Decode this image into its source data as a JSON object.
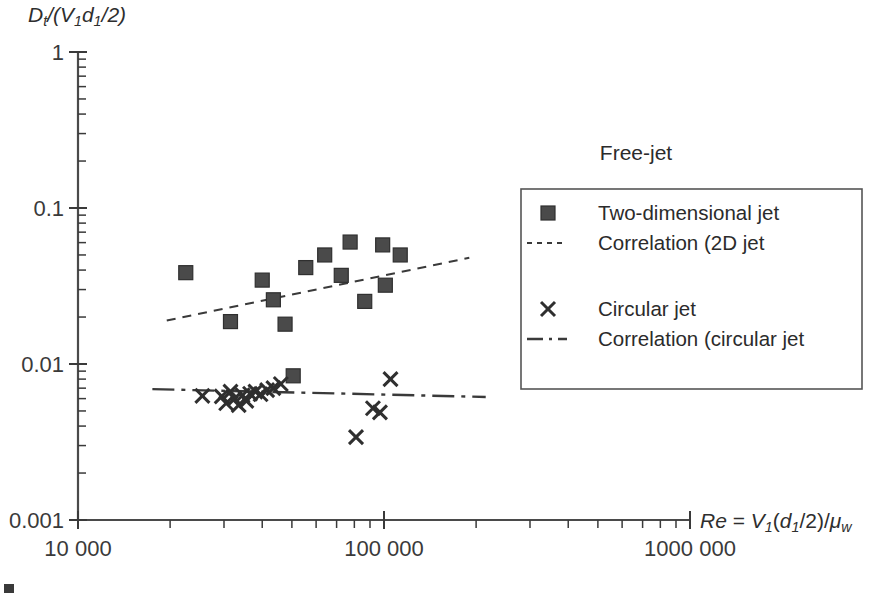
{
  "figure": {
    "background_color": "#ffffff",
    "ink_color": "#3a3a3a",
    "marker_color": "#4a4a4a",
    "note": "Free-jet",
    "caption_fragment": ""
  },
  "chart_data": {
    "type": "scatter",
    "title": "",
    "xlabel": "Re = V1(d1/2)/μw",
    "ylabel": "Dt/(V1d1/2)",
    "xscale": "log",
    "yscale": "log",
    "xlim": [
      10000,
      1000000
    ],
    "ylim": [
      0.001,
      1
    ],
    "grid": false,
    "x_tick_labels": [
      "10 000",
      "100 000",
      "1000 000"
    ],
    "x_tick_values": [
      10000,
      100000,
      1000000
    ],
    "y_tick_labels": [
      "1",
      "0.1",
      "0.01",
      "0.001"
    ],
    "y_tick_values": [
      1,
      0.1,
      0.01,
      0.001
    ],
    "legend_position": "right",
    "series": [
      {
        "name": "Two-dimensional jet",
        "marker": "square",
        "points": [
          [
            22500,
            0.0385
          ],
          [
            31500,
            0.0187
          ],
          [
            40000,
            0.0345
          ],
          [
            43500,
            0.0258
          ],
          [
            47500,
            0.018
          ],
          [
            50500,
            0.0084
          ],
          [
            55500,
            0.0415
          ],
          [
            64000,
            0.05
          ],
          [
            72500,
            0.037
          ],
          [
            77500,
            0.0605
          ],
          [
            86500,
            0.0252
          ],
          [
            99000,
            0.058
          ],
          [
            101000,
            0.032
          ],
          [
            113000,
            0.05
          ]
        ]
      },
      {
        "name": "Circular jet",
        "marker": "cross",
        "points": [
          [
            25500,
            0.00625
          ],
          [
            29500,
            0.0062
          ],
          [
            30500,
            0.0056
          ],
          [
            31500,
            0.00665
          ],
          [
            32500,
            0.006
          ],
          [
            33500,
            0.00545
          ],
          [
            34500,
            0.0063
          ],
          [
            35500,
            0.0058
          ],
          [
            36500,
            0.00645
          ],
          [
            38000,
            0.00665
          ],
          [
            39500,
            0.0064
          ],
          [
            41500,
            0.0068
          ],
          [
            43500,
            0.007
          ],
          [
            46000,
            0.00745
          ],
          [
            81000,
            0.0034
          ],
          [
            92000,
            0.0052
          ],
          [
            97000,
            0.0049
          ],
          [
            105000,
            0.008
          ]
        ]
      }
    ],
    "fit_lines": [
      {
        "name": "Correlation (2D jet x1/(d1/2) = 9)",
        "style": "dashed",
        "x_start": 19500,
        "x_end": 190000,
        "y_start": 0.019,
        "y_end": 0.048
      },
      {
        "name": "Correlation (circular jet x1/d1 = 4)",
        "style": "dashdot",
        "x_start": 17500,
        "x_end": 215000,
        "y_start": 0.0069,
        "y_end": 0.00615
      }
    ]
  },
  "legend": {
    "entries": [
      {
        "key": "square",
        "line1": "Two-dimensional jet",
        "line2": ""
      },
      {
        "key": "dashed",
        "line1": "Correlation (2D jet",
        "line2": "x1/(d1/2) = 9)"
      },
      {
        "key": "cross",
        "line1": "Circular jet",
        "line2": ""
      },
      {
        "key": "dashdot",
        "line1": "Correlation (circular jet",
        "line2": "x1/d1 = 4)"
      }
    ]
  }
}
